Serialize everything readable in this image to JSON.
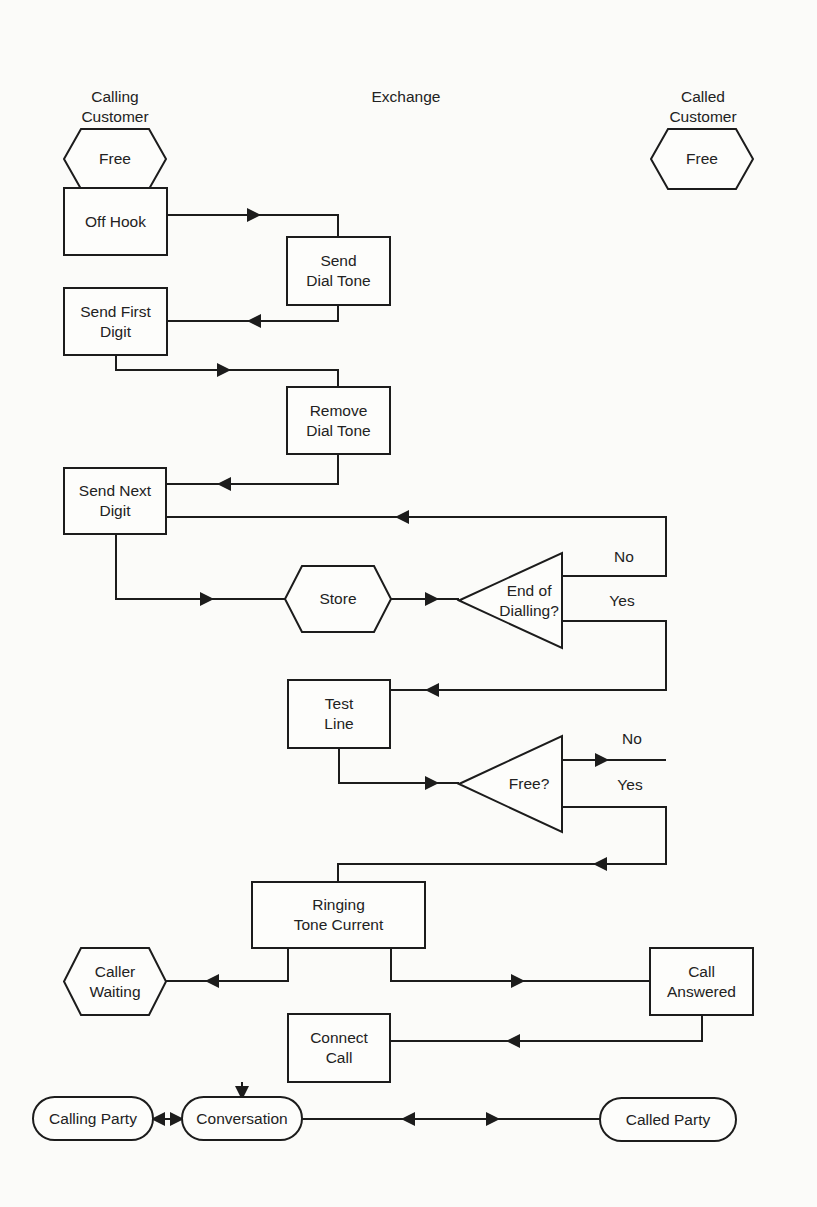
{
  "page_header": {
    "page_number": "22",
    "running_title": "HANDBOOK OF DATA COMMUNICATIONS"
  },
  "columns": {
    "calling": [
      "Calling",
      "Customer"
    ],
    "exchange": [
      "Exchange"
    ],
    "called": [
      "Called",
      "Customer"
    ]
  },
  "nodes": [
    {
      "id": "free-calling",
      "shape": "hexagon",
      "x": 64,
      "y": 129,
      "w": 102,
      "h": 60,
      "lines": [
        "Free"
      ]
    },
    {
      "id": "free-called",
      "shape": "hexagon",
      "x": 651,
      "y": 129,
      "w": 102,
      "h": 60,
      "lines": [
        "Free"
      ]
    },
    {
      "id": "off-hook",
      "shape": "rect",
      "x": 64,
      "y": 188,
      "w": 103,
      "h": 67,
      "lines": [
        "Off Hook"
      ]
    },
    {
      "id": "send-dial-tone",
      "shape": "rect",
      "x": 287,
      "y": 237,
      "w": 103,
      "h": 68,
      "lines": [
        "Send",
        "Dial Tone"
      ]
    },
    {
      "id": "send-first-digit",
      "shape": "rect",
      "x": 64,
      "y": 288,
      "w": 103,
      "h": 67,
      "lines": [
        "Send First",
        "Digit"
      ]
    },
    {
      "id": "remove-dial-tone",
      "shape": "rect",
      "x": 287,
      "y": 387,
      "w": 103,
      "h": 67,
      "lines": [
        "Remove",
        "Dial Tone"
      ]
    },
    {
      "id": "send-next-digit",
      "shape": "rect",
      "x": 64,
      "y": 468,
      "w": 102,
      "h": 66,
      "lines": [
        "Send Next",
        "Digit"
      ]
    },
    {
      "id": "store",
      "shape": "hexagon",
      "x": 285,
      "y": 566,
      "w": 106,
      "h": 66,
      "lines": [
        "Store"
      ]
    },
    {
      "id": "end-of-dialling",
      "shape": "triangle",
      "x": 459,
      "y": 553,
      "w": 103,
      "h": 95,
      "lines": [
        "End of",
        "Dialling?"
      ]
    },
    {
      "id": "test-line",
      "shape": "rect",
      "x": 288,
      "y": 680,
      "w": 102,
      "h": 68,
      "lines": [
        "Test",
        "Line"
      ]
    },
    {
      "id": "free-check",
      "shape": "triangle",
      "x": 459,
      "y": 736,
      "w": 103,
      "h": 96,
      "lines": [
        "Free?"
      ]
    },
    {
      "id": "ringing-tone-current",
      "shape": "rect",
      "x": 252,
      "y": 882,
      "w": 173,
      "h": 66,
      "lines": [
        "Ringing",
        "Tone Current"
      ]
    },
    {
      "id": "caller-waiting",
      "shape": "hexagon",
      "x": 64,
      "y": 948,
      "w": 102,
      "h": 67,
      "lines": [
        "Caller",
        "Waiting"
      ]
    },
    {
      "id": "call-answered",
      "shape": "rect",
      "x": 650,
      "y": 948,
      "w": 103,
      "h": 67,
      "lines": [
        "Call",
        "Answered"
      ]
    },
    {
      "id": "connect-call",
      "shape": "rect",
      "x": 288,
      "y": 1014,
      "w": 102,
      "h": 68,
      "lines": [
        "Connect",
        "Call"
      ]
    },
    {
      "id": "calling-party",
      "shape": "terminal",
      "x": 33,
      "y": 1097,
      "w": 120,
      "h": 43,
      "lines": [
        "Calling Party"
      ]
    },
    {
      "id": "conversation",
      "shape": "terminal",
      "x": 182,
      "y": 1097,
      "w": 120,
      "h": 43,
      "lines": [
        "Conversation"
      ]
    },
    {
      "id": "called-party",
      "shape": "terminal",
      "x": 600,
      "y": 1098,
      "w": 136,
      "h": 43,
      "lines": [
        "Called Party"
      ]
    }
  ],
  "edges": [
    {
      "from": "free-calling",
      "to": "off-hook",
      "points": [
        [
          116,
          189
        ],
        [
          116,
          188
        ]
      ],
      "arrows": [
        [
          116,
          183,
          "down"
        ]
      ]
    },
    {
      "from": "off-hook",
      "to": "send-dial-tone",
      "points": [
        [
          167,
          215
        ],
        [
          338,
          215
        ],
        [
          338,
          237
        ]
      ],
      "arrows": [
        [
          254,
          215,
          "right"
        ]
      ]
    },
    {
      "from": "send-dial-tone",
      "to": "send-first-digit",
      "points": [
        [
          338,
          305
        ],
        [
          338,
          321
        ],
        [
          167,
          321
        ]
      ],
      "arrows": [
        [
          254,
          321,
          "left"
        ]
      ]
    },
    {
      "from": "send-first-digit",
      "to": "remove-dial-tone",
      "points": [
        [
          116,
          355
        ],
        [
          116,
          370
        ],
        [
          338,
          370
        ],
        [
          338,
          387
        ]
      ],
      "arrows": [
        [
          224,
          370,
          "right"
        ]
      ]
    },
    {
      "from": "remove-dial-tone",
      "to": "send-next-digit",
      "points": [
        [
          338,
          454
        ],
        [
          338,
          484
        ],
        [
          166,
          484
        ]
      ],
      "arrows": [
        [
          224,
          484,
          "left"
        ]
      ]
    },
    {
      "from": "send-next-digit",
      "to": "store",
      "points": [
        [
          116,
          534
        ],
        [
          116,
          599
        ],
        [
          285,
          599
        ]
      ],
      "arrows": [
        [
          207,
          599,
          "right"
        ]
      ]
    },
    {
      "from": "store",
      "to": "end-of-dialling",
      "points": [
        [
          391,
          599
        ],
        [
          459,
          599
        ]
      ],
      "arrows": [
        [
          432,
          599,
          "right"
        ]
      ]
    },
    {
      "from": "end-of-dialling",
      "to": "send-next-digit",
      "label": "No",
      "label_pos": [
        624,
        562
      ],
      "points": [
        [
          562,
          576
        ],
        [
          666,
          576
        ],
        [
          666,
          517
        ],
        [
          166,
          517
        ]
      ],
      "arrows": [
        [
          402,
          517,
          "left"
        ]
      ]
    },
    {
      "from": "end-of-dialling",
      "to": "test-line",
      "label": "Yes",
      "label_pos": [
        622,
        606
      ],
      "points": [
        [
          562,
          621
        ],
        [
          666,
          621
        ],
        [
          666,
          690
        ],
        [
          390,
          690
        ]
      ],
      "arrows": [
        [
          432,
          690,
          "left"
        ]
      ]
    },
    {
      "from": "test-line",
      "to": "free-check",
      "points": [
        [
          339,
          748
        ],
        [
          339,
          783
        ],
        [
          459,
          783
        ]
      ],
      "arrows": [
        [
          432,
          783,
          "right"
        ]
      ]
    },
    {
      "from": "free-check",
      "to": "exit-no",
      "label": "No",
      "label_pos": [
        632,
        744
      ],
      "points": [
        [
          562,
          760
        ],
        [
          666,
          760
        ]
      ],
      "arrows": [
        [
          602,
          760,
          "right"
        ]
      ]
    },
    {
      "from": "free-check",
      "to": "ringing-tone-current",
      "label": "Yes",
      "label_pos": [
        630,
        790
      ],
      "points": [
        [
          562,
          807
        ],
        [
          666,
          807
        ],
        [
          666,
          864
        ],
        [
          338,
          864
        ],
        [
          338,
          882
        ]
      ],
      "arrows": [
        [
          600,
          864,
          "left"
        ]
      ]
    },
    {
      "from": "ringing-tone-current",
      "to": "caller-waiting",
      "points": [
        [
          288,
          948
        ],
        [
          288,
          981
        ],
        [
          166,
          981
        ]
      ],
      "arrows": [
        [
          212,
          981,
          "left"
        ]
      ]
    },
    {
      "from": "ringing-tone-current",
      "to": "call-answered",
      "points": [
        [
          391,
          948
        ],
        [
          391,
          981
        ],
        [
          650,
          981
        ]
      ],
      "arrows": [
        [
          518,
          981,
          "right"
        ]
      ]
    },
    {
      "from": "call-answered",
      "to": "connect-call",
      "points": [
        [
          702,
          1015
        ],
        [
          702,
          1041
        ],
        [
          390,
          1041
        ]
      ],
      "arrows": [
        [
          513,
          1041,
          "left"
        ]
      ]
    },
    {
      "from": "connect-call",
      "to": "conversation",
      "points": [
        [
          242,
          1082
        ],
        [
          242,
          1097
        ]
      ],
      "arrows": [
        [
          242,
          1093,
          "down"
        ]
      ]
    },
    {
      "from": "calling-party",
      "to": "conversation",
      "points": [
        [
          153,
          1119
        ],
        [
          182,
          1119
        ]
      ],
      "arrows": [
        [
          158,
          1119,
          "left"
        ],
        [
          177,
          1119,
          "right"
        ]
      ]
    },
    {
      "from": "conversation",
      "to": "called-party",
      "points": [
        [
          302,
          1119
        ],
        [
          600,
          1119
        ]
      ],
      "arrows": [
        [
          408,
          1119,
          "left"
        ],
        [
          493,
          1119,
          "right"
        ]
      ]
    }
  ]
}
